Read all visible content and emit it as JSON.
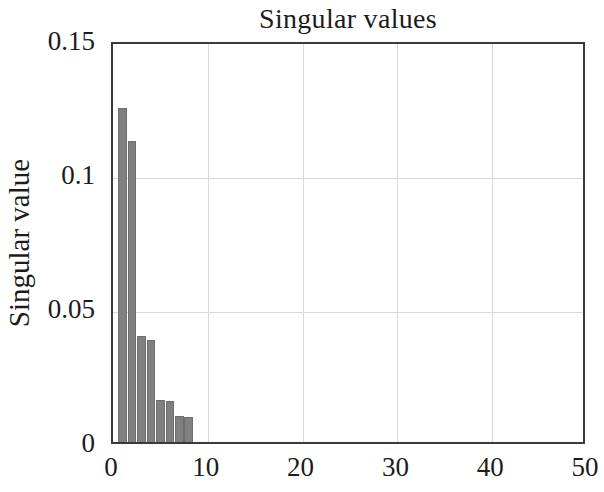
{
  "chart_data": {
    "type": "bar",
    "title": "Singular values",
    "xlabel": "",
    "ylabel": "Singular value",
    "xlim": [
      0,
      50
    ],
    "ylim": [
      0,
      0.15
    ],
    "grid": true,
    "legend": null,
    "bar_color": "#808080",
    "axis_color": "#3a3a3a",
    "grid_color": "#d9d9d9",
    "x_ticks": [
      0,
      10,
      20,
      30,
      40,
      50
    ],
    "x_tick_labels": [
      "0",
      "10",
      "20",
      "30",
      "40",
      "50"
    ],
    "y_ticks": [
      0,
      0.05,
      0.1,
      0.15
    ],
    "y_tick_labels": [
      "0",
      "0.05",
      "0.1",
      "0.15"
    ],
    "x": [
      1,
      2,
      3,
      4,
      5,
      6,
      7,
      8
    ],
    "values": [
      0.1245,
      0.1125,
      0.0395,
      0.038,
      0.0156,
      0.0152,
      0.0098,
      0.0095
    ],
    "categories": [
      "1",
      "2",
      "3",
      "4",
      "5",
      "6",
      "7",
      "8"
    ]
  }
}
